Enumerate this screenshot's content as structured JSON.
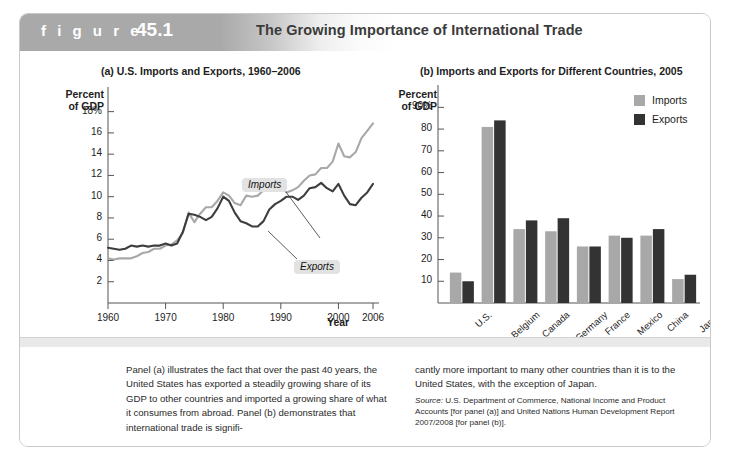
{
  "figure": {
    "label": "f i g u r e",
    "number": "45.1",
    "title": "The Growing Importance of International Trade"
  },
  "panel_a": {
    "title": "(a) U.S. Imports and Exports, 1960–2006",
    "y_axis_name": "Percent\nof GDP",
    "x_axis_name": "Year",
    "callout_imports": "Imports",
    "callout_exports": "Exports"
  },
  "panel_b": {
    "title": "(b) Imports and Exports for Different Countries, 2005",
    "y_axis_name": "Percent\nof GDP",
    "legend": [
      {
        "label": "Imports",
        "color": "#a8a8a8"
      },
      {
        "label": "Exports",
        "color": "#333333"
      }
    ]
  },
  "caption": {
    "left": "Panel (a) illustrates the fact that over the past 40 years, the United States has exported a steadily growing share of its GDP to other countries and imported a growing share of what it consumes from abroad. Panel (b) demonstrates that international trade is signifi-",
    "right": "cantly more important to many other countries than it is to the United States, with the exception of Japan.",
    "source_word": "Source:",
    "source_text": " U.S. Department of Commerce, National Income and Product Accounts [for panel (a)] and United Nations Human Development Report 2007/2008 [for panel (b)]."
  },
  "chart_data": [
    {
      "type": "line",
      "title": "(a) U.S. Imports and Exports, 1960–2006",
      "xlabel": "Year",
      "ylabel": "Percent of GDP",
      "xlim": [
        1960,
        2006
      ],
      "ylim": [
        0,
        19
      ],
      "xticks": [
        1960,
        1970,
        1980,
        1990,
        2000,
        2006
      ],
      "yticks": [
        2,
        4,
        6,
        8,
        10,
        12,
        14,
        16,
        18
      ],
      "ytick_labels": [
        "2",
        "4",
        "6",
        "8",
        "10",
        "12",
        "14",
        "16",
        "18%"
      ],
      "grid": false,
      "legend": "annotated-callouts",
      "x": [
        1960,
        1961,
        1962,
        1963,
        1964,
        1965,
        1966,
        1967,
        1968,
        1969,
        1970,
        1971,
        1972,
        1973,
        1974,
        1975,
        1976,
        1977,
        1978,
        1979,
        1980,
        1981,
        1982,
        1983,
        1984,
        1985,
        1986,
        1987,
        1988,
        1989,
        1990,
        1991,
        1992,
        1993,
        1994,
        1995,
        1996,
        1997,
        1998,
        1999,
        2000,
        2001,
        2002,
        2003,
        2004,
        2005,
        2006
      ],
      "series": [
        {
          "name": "Imports",
          "color": "#a8a8a8",
          "values": [
            4.2,
            4.1,
            4.2,
            4.2,
            4.2,
            4.4,
            4.7,
            4.8,
            5.1,
            5.1,
            5.4,
            5.5,
            5.9,
            6.6,
            8.5,
            7.6,
            8.4,
            9.0,
            9.0,
            9.6,
            10.4,
            10.1,
            9.4,
            9.2,
            10.1,
            10.0,
            10.1,
            10.6,
            10.8,
            10.8,
            10.9,
            10.4,
            10.6,
            10.9,
            11.5,
            12.0,
            12.1,
            12.7,
            12.7,
            13.3,
            15.0,
            13.8,
            13.7,
            14.2,
            15.5,
            16.2,
            16.9
          ]
        },
        {
          "name": "Exports",
          "color": "#3d3d3d",
          "values": [
            5.2,
            5.1,
            5.0,
            5.1,
            5.4,
            5.3,
            5.4,
            5.3,
            5.4,
            5.4,
            5.6,
            5.4,
            5.6,
            6.7,
            8.4,
            8.3,
            8.1,
            7.8,
            8.1,
            8.9,
            10.0,
            9.6,
            8.5,
            7.7,
            7.5,
            7.2,
            7.2,
            7.7,
            8.8,
            9.3,
            9.6,
            10.0,
            10.0,
            9.7,
            10.1,
            10.8,
            10.9,
            11.3,
            10.8,
            10.5,
            11.2,
            10.1,
            9.3,
            9.2,
            9.9,
            10.4,
            11.2
          ]
        }
      ]
    },
    {
      "type": "bar",
      "title": "(b) Imports and Exports for Different Countries, 2005",
      "xlabel": "",
      "ylabel": "Percent of GDP",
      "ylim": [
        0,
        92
      ],
      "yticks": [
        10,
        20,
        30,
        40,
        50,
        60,
        70,
        80,
        90
      ],
      "ytick_labels": [
        "10",
        "20",
        "30",
        "40",
        "50",
        "60",
        "70",
        "80",
        "90%"
      ],
      "grid": false,
      "legend_position": "top-right",
      "categories": [
        "U.S.",
        "Belgium",
        "Canada",
        "Germany",
        "France",
        "Mexico",
        "China",
        "Japan"
      ],
      "series": [
        {
          "name": "Imports",
          "color": "#a8a8a8",
          "values": [
            14,
            81,
            34,
            33,
            26,
            31,
            31,
            11
          ]
        },
        {
          "name": "Exports",
          "color": "#333333",
          "values": [
            10,
            84,
            38,
            39,
            26,
            30,
            34,
            13
          ]
        }
      ]
    }
  ]
}
